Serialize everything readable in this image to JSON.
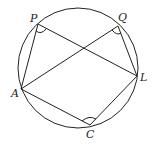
{
  "diagram": {
    "type": "inscribed-figure",
    "circle": {
      "cx": 78,
      "cy": 68,
      "r": 60
    },
    "points": {
      "P": {
        "label": "P",
        "x": 38,
        "y": 24
      },
      "Q": {
        "label": "Q",
        "x": 118,
        "y": 26
      },
      "L": {
        "label": "L",
        "x": 137,
        "y": 76
      },
      "A": {
        "label": "A",
        "x": 21,
        "y": 89
      },
      "C": {
        "label": "C",
        "x": 90,
        "y": 125
      }
    },
    "segments": [
      [
        "P",
        "A"
      ],
      [
        "P",
        "L"
      ],
      [
        "Q",
        "A"
      ],
      [
        "Q",
        "L"
      ],
      [
        "A",
        "C"
      ],
      [
        "C",
        "L"
      ]
    ],
    "angle_marks": [
      "P",
      "Q",
      "C"
    ],
    "colors": {
      "stroke": "#222222",
      "background": "#ffffff"
    }
  }
}
